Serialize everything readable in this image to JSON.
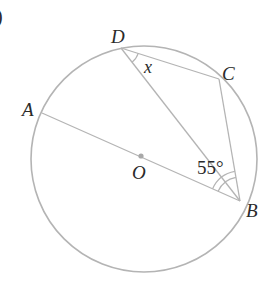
{
  "figure": {
    "part_label": ")",
    "colors": {
      "line": "#b4b4b4",
      "text": "#2a2a2a",
      "center_dot": "#a8a8a8",
      "background": "#ffffff"
    },
    "circle": {
      "center": "O",
      "cx": 144,
      "cy": 159,
      "r": 113
    },
    "points": {
      "A": {
        "label": "A",
        "x": 42,
        "y": 113
      },
      "B": {
        "label": "B",
        "x": 240,
        "y": 201
      },
      "C": {
        "label": "C",
        "x": 219,
        "y": 79
      },
      "D": {
        "label": "D",
        "x": 121,
        "y": 48
      },
      "O": {
        "label": "O",
        "x": 141,
        "y": 156
      }
    },
    "segments": [
      "AB",
      "DB",
      "DC",
      "CB"
    ],
    "angles": {
      "x": {
        "label": "x",
        "vertex": "D",
        "between": [
          "DC",
          "DB"
        ]
      },
      "B": {
        "label": "55°",
        "vertex": "B",
        "between": [
          "BA",
          "BC"
        ],
        "value_deg": 55
      }
    }
  }
}
